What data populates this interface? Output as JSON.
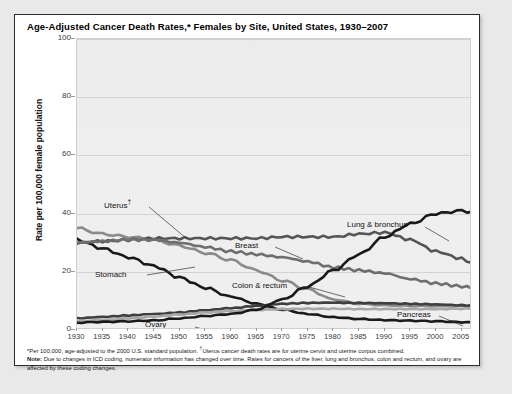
{
  "card": {
    "title": "Age-Adjusted Cancer Death Rates,* Females by Site, United States, 1930–2007"
  },
  "footnotes": {
    "line1_pre": "*Per 100,000, age-adjusted to the 2000 U.S. standard population. ",
    "line1_dagger": "†",
    "line1_post": "Uterus cancer death rates are for uterine cervix and uterine corpus combined.",
    "note_label": "Note:",
    "note_text": " Due to changes in ICD coding, numerator information has changed over time. Rates for cancers of the liver, lung and bronchus, colon and rectum, and ovary are affected by these coding changes."
  },
  "annotations": [
    {
      "name": "uterus",
      "text": "Uterus",
      "dagger": "†",
      "left": 27,
      "top": 160
    },
    {
      "name": "stomach",
      "text": "Stomach",
      "dagger": "",
      "left": 18,
      "top": 232
    },
    {
      "name": "ovary",
      "text": "Ovary",
      "dagger": "",
      "left": 68,
      "top": 282
    },
    {
      "name": "breast",
      "text": "Breast",
      "dagger": "",
      "left": 158,
      "top": 203
    },
    {
      "name": "colon-rectum",
      "text": "Colon & rectum",
      "dagger": "",
      "left": 155,
      "top": 243
    },
    {
      "name": "lung-bronchus",
      "text": "Lung & bronchus",
      "dagger": "",
      "left": 270,
      "top": 182
    },
    {
      "name": "pancreas",
      "text": "Pancreas",
      "dagger": "",
      "left": 320,
      "top": 272
    }
  ],
  "chart_data": {
    "type": "line",
    "title": "Age-Adjusted Cancer Death Rates,* Females by Site, United States, 1930–2007",
    "xlabel": "",
    "ylabel": "Rate per 100,000 female population",
    "xlim": [
      1930,
      2007
    ],
    "ylim": [
      0,
      100
    ],
    "yticks": [
      0,
      20,
      40,
      60,
      80,
      100
    ],
    "xticks": [
      1930,
      1935,
      1940,
      1945,
      1950,
      1955,
      1960,
      1965,
      1970,
      1975,
      1980,
      1985,
      1990,
      1995,
      2000,
      2005
    ],
    "grid": true,
    "legend": "inline-annotations",
    "colors": {
      "lung_bronchus": "#1a1a1a",
      "stomach": "#1a1a1a",
      "breast": "#555555",
      "uterus": "#8a8a8a",
      "colon_rectum": "#6e6e6e",
      "ovary": "#3f3f3f",
      "pancreas": "#a8a8a8"
    },
    "x": [
      1930,
      1935,
      1940,
      1945,
      1950,
      1955,
      1960,
      1965,
      1970,
      1975,
      1980,
      1985,
      1990,
      1995,
      2000,
      2005,
      2007
    ],
    "series": [
      {
        "name": "Uterus†",
        "key": "uterus",
        "values": [
          35.0,
          33.0,
          32.0,
          31.0,
          29.0,
          26.5,
          24.0,
          20.5,
          17.0,
          14.0,
          10.5,
          9.0,
          8.5,
          8.3,
          8.2,
          8.2,
          8.2
        ]
      },
      {
        "name": "Stomach",
        "key": "stomach",
        "values": [
          31.0,
          28.0,
          25.0,
          22.0,
          18.0,
          14.5,
          11.5,
          9.0,
          7.0,
          5.5,
          4.4,
          3.8,
          3.4,
          3.2,
          3.0,
          2.7,
          2.6
        ]
      },
      {
        "name": "Breast",
        "key": "breast",
        "values": [
          30.0,
          30.5,
          31.0,
          31.5,
          31.5,
          31.5,
          31.5,
          31.5,
          32.0,
          32.0,
          32.0,
          33.0,
          33.5,
          31.0,
          27.0,
          24.5,
          23.0
        ]
      },
      {
        "name": "Colon & rectum",
        "key": "colon_rectum",
        "values": [
          30.0,
          30.5,
          31.0,
          31.0,
          30.0,
          28.5,
          27.0,
          26.0,
          25.0,
          23.5,
          21.5,
          20.5,
          19.5,
          17.5,
          16.0,
          15.0,
          14.5
        ]
      },
      {
        "name": "Ovary",
        "key": "ovary",
        "values": [
          4.0,
          4.5,
          5.0,
          5.5,
          6.0,
          6.8,
          7.5,
          8.3,
          9.0,
          9.3,
          9.4,
          9.3,
          9.2,
          9.0,
          8.8,
          8.5,
          8.4
        ]
      },
      {
        "name": "Pancreas",
        "key": "pancreas",
        "values": [
          3.0,
          3.4,
          4.0,
          4.6,
          5.3,
          6.0,
          6.5,
          6.9,
          7.2,
          7.3,
          7.3,
          7.2,
          7.2,
          7.2,
          7.2,
          7.3,
          7.4
        ]
      },
      {
        "name": "Lung & bronchus",
        "key": "lung_bronchus",
        "values": [
          2.5,
          2.8,
          3.0,
          3.3,
          4.0,
          4.8,
          5.5,
          7.0,
          10.5,
          15.0,
          20.5,
          26.0,
          32.0,
          36.5,
          40.0,
          41.0,
          40.5
        ]
      }
    ]
  }
}
